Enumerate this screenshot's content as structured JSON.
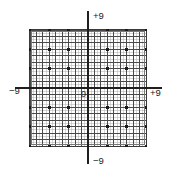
{
  "figure": {
    "name": "cartesian-grid-graph",
    "background_color": "#ffffff",
    "box": {
      "left": 30,
      "top": 30,
      "right": 146,
      "bottom": 146,
      "border_color": "#3a3a3a",
      "inner_border_color": "#6e6e6e"
    },
    "origin": {
      "x": 88,
      "y": 88
    }
  },
  "labels": {
    "top": "+9",
    "right": "+9",
    "left": "−9",
    "bottom": "−9",
    "origin": "0"
  },
  "chart_data": {
    "type": "scatter",
    "title": "",
    "subtitle": "",
    "xlabel": "",
    "ylabel": "",
    "xlim": [
      -9,
      9
    ],
    "ylim": [
      -9,
      9
    ],
    "grid": true,
    "legend": "none",
    "x_tick_labels": [
      "−9",
      "0",
      "+9"
    ],
    "y_tick_labels": [
      "−9",
      "0",
      "+9"
    ],
    "x_tick_values": [
      -9,
      0,
      9
    ],
    "y_tick_values": [
      -9,
      0,
      9
    ],
    "minor_grid_step": 0.5,
    "major_grid_step": 1,
    "marker_step": 3,
    "marker_color": "#1a1a1a",
    "grid_minor_color": "#b9b9b9",
    "grid_major_color": "#4a4a4a",
    "axis_color": "#1f1f1f",
    "series": [
      {
        "name": "grid-nodes",
        "points": [
          [
            -9,
            9
          ],
          [
            -6,
            9
          ],
          [
            -3,
            9
          ],
          [
            0,
            9
          ],
          [
            3,
            9
          ],
          [
            6,
            9
          ],
          [
            9,
            9
          ],
          [
            -9,
            6
          ],
          [
            -6,
            6
          ],
          [
            -3,
            6
          ],
          [
            0,
            6
          ],
          [
            3,
            6
          ],
          [
            6,
            6
          ],
          [
            9,
            6
          ],
          [
            -9,
            3
          ],
          [
            -6,
            3
          ],
          [
            -3,
            3
          ],
          [
            0,
            3
          ],
          [
            3,
            3
          ],
          [
            6,
            3
          ],
          [
            9,
            3
          ],
          [
            -9,
            0
          ],
          [
            -6,
            0
          ],
          [
            -3,
            0
          ],
          [
            0,
            0
          ],
          [
            3,
            0
          ],
          [
            6,
            0
          ],
          [
            9,
            0
          ],
          [
            -9,
            -3
          ],
          [
            -6,
            -3
          ],
          [
            -3,
            -3
          ],
          [
            0,
            -3
          ],
          [
            3,
            -3
          ],
          [
            6,
            -3
          ],
          [
            9,
            -3
          ],
          [
            -9,
            -6
          ],
          [
            -6,
            -6
          ],
          [
            -3,
            -6
          ],
          [
            0,
            -6
          ],
          [
            3,
            -6
          ],
          [
            6,
            -6
          ],
          [
            9,
            -6
          ],
          [
            -9,
            -9
          ],
          [
            -6,
            -9
          ],
          [
            -3,
            -9
          ],
          [
            0,
            -9
          ],
          [
            3,
            -9
          ],
          [
            6,
            -9
          ],
          [
            9,
            -9
          ]
        ]
      }
    ]
  }
}
